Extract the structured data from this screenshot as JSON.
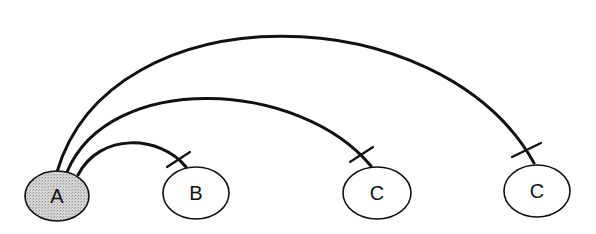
{
  "diagram": {
    "type": "arc-diagram",
    "colors": {
      "stroke": "#111111",
      "source_fill": "#c9c9c9",
      "target_fill": "#ffffff"
    },
    "nodes": [
      {
        "id": "n0",
        "label": "A",
        "cx": 57,
        "cy": 196,
        "rx": 32,
        "ry": 25,
        "fill": "#c9c9c9"
      },
      {
        "id": "n1",
        "label": "B",
        "cx": 196,
        "cy": 193,
        "rx": 33,
        "ry": 26,
        "fill": "#ffffff"
      },
      {
        "id": "n2",
        "label": "C",
        "cx": 377,
        "cy": 193,
        "rx": 34,
        "ry": 26,
        "fill": "#ffffff"
      },
      {
        "id": "n3",
        "label": "C",
        "cx": 537,
        "cy": 191,
        "rx": 33,
        "ry": 26,
        "fill": "#ffffff"
      }
    ],
    "edges": [
      {
        "from": "A",
        "to": "B",
        "path": "M78,175 C100,132 160,135 186,167",
        "tick": [
          167,
          167,
          190,
          152
        ]
      },
      {
        "from": "A",
        "to": "C",
        "path": "M67,172 C110,70 300,80 371,166",
        "tick": [
          350,
          162,
          373,
          147
        ]
      },
      {
        "from": "A",
        "to": "C",
        "path": "M57,172 C110,-10 440,-5 534,163",
        "tick": [
          512,
          157,
          541,
          143
        ]
      }
    ]
  }
}
